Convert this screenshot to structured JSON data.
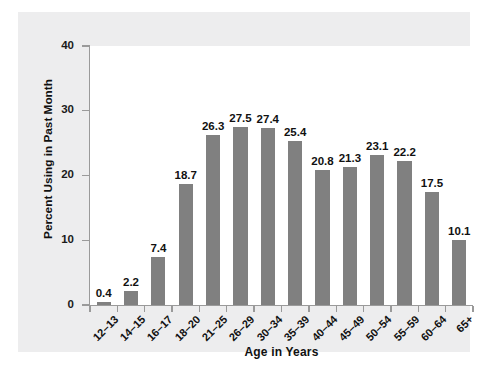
{
  "chart_data": {
    "type": "bar",
    "title": "",
    "subtitle": "",
    "xlabel": "Age in Years",
    "ylabel": "Percent Using in Past Month",
    "categories": [
      "12–13",
      "14–15",
      "16–17",
      "18–20",
      "21–25",
      "26–29",
      "30–34",
      "35–39",
      "40–44",
      "45–49",
      "50–54",
      "55–59",
      "60–64",
      "65+"
    ],
    "values": [
      0.4,
      2.2,
      7.4,
      18.7,
      26.3,
      27.5,
      27.4,
      25.4,
      20.8,
      21.3,
      23.1,
      22.2,
      17.5,
      10.1
    ],
    "value_labels": [
      "0.4",
      "2.2",
      "7.4",
      "18.7",
      "26.3",
      "27.5",
      "27.4",
      "25.4",
      "20.8",
      "21.3",
      "23.1",
      "22.2",
      "17.5",
      "10.1"
    ],
    "ylim": [
      0,
      40
    ],
    "yticks": [
      0,
      10,
      20,
      30,
      40
    ],
    "ytick_labels": [
      "0",
      "10",
      "20",
      "30",
      "40"
    ],
    "grid": false,
    "legend": null,
    "bar_color": "#808080",
    "panel_color": "#ededee",
    "plot_background": "#ffffff",
    "axis_color": "#9a9a9a",
    "text_color": "#111111"
  }
}
